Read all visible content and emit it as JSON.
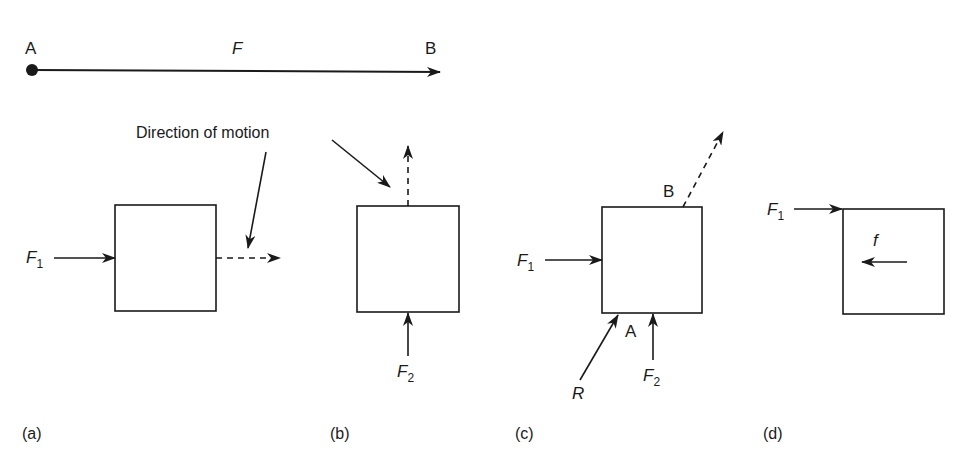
{
  "diagram": {
    "top_vector": {
      "start_label": "A",
      "end_label": "B",
      "force_label": "F"
    },
    "annotation": {
      "text": "Direction of motion"
    },
    "panels": [
      {
        "id": "a",
        "caption": "(a)",
        "force_labels": [
          {
            "name": "F",
            "sub": "1"
          }
        ]
      },
      {
        "id": "b",
        "caption": "(b)",
        "force_labels": [
          {
            "name": "F",
            "sub": "2"
          }
        ]
      },
      {
        "id": "c",
        "caption": "(c)",
        "point_labels": [
          "B",
          "A"
        ],
        "force_labels": [
          {
            "name": "F",
            "sub": "1"
          },
          {
            "name": "R",
            "sub": ""
          },
          {
            "name": "F",
            "sub": "2"
          }
        ]
      },
      {
        "id": "d",
        "caption": "(d)",
        "force_labels": [
          {
            "name": "F",
            "sub": "1"
          },
          {
            "name": "f",
            "sub": ""
          }
        ]
      }
    ],
    "colors": {
      "stroke": "#1a1a1a",
      "background": "#ffffff"
    }
  }
}
